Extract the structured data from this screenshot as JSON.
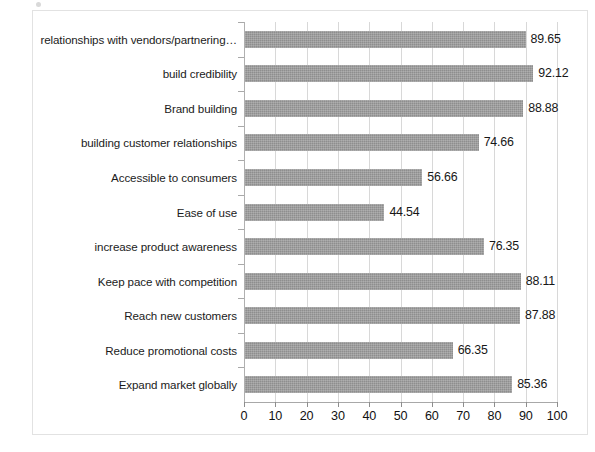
{
  "chart_data": {
    "type": "bar",
    "orientation": "horizontal",
    "title": "",
    "subtitle": "",
    "xlabel": "",
    "ylabel": "",
    "xlim": [
      0,
      100
    ],
    "xticks": [
      0,
      10,
      20,
      30,
      40,
      50,
      60,
      70,
      80,
      90,
      100
    ],
    "xtick_labels": [
      "0",
      "10",
      "20",
      "30",
      "40",
      "50",
      "60",
      "70",
      "80",
      "90",
      "100"
    ],
    "grid": true,
    "grid_axis": "x",
    "legend": false,
    "legend_position": "none",
    "bar_color": "#8e8e8e",
    "value_label_format": "2-decimal",
    "categories": [
      "relationships with vendors/partnering…",
      "build credibility",
      "Brand building",
      "building customer relationships",
      "Accessible to consumers",
      "Ease of use",
      "increase product awareness",
      "Keep pace with competition",
      "Reach new customers",
      "Reduce promotional costs",
      "Expand market globally"
    ],
    "values": [
      89.65,
      92.12,
      88.88,
      74.66,
      56.66,
      44.54,
      76.35,
      88.11,
      87.88,
      66.35,
      85.36
    ],
    "value_labels": [
      "89.65",
      "92.12",
      "88.88",
      "74.66",
      "56.66",
      "44.54",
      "76.35",
      "88.11",
      "87.88",
      "66.35",
      "85.36"
    ]
  }
}
